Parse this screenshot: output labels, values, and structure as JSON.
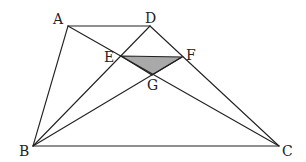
{
  "figure": {
    "type": "geometry",
    "colors": {
      "stroke": "#222222",
      "shade": "#a9a9a9",
      "background": "#ffffff"
    },
    "points": {
      "A": {
        "label": "A",
        "x": 68,
        "y": 26
      },
      "D": {
        "label": "D",
        "x": 150,
        "y": 26
      },
      "B": {
        "label": "B",
        "x": 33,
        "y": 146
      },
      "C": {
        "label": "C",
        "x": 279,
        "y": 146
      },
      "E": {
        "label": "E",
        "x": 121,
        "y": 56
      },
      "F": {
        "label": "F",
        "x": 182,
        "y": 57
      },
      "G": {
        "label": "G",
        "x": 152,
        "y": 75
      }
    },
    "segments": [
      "AD",
      "AB",
      "BC",
      "DC",
      "AC",
      "BD",
      "BF",
      "EF"
    ],
    "shaded_region": [
      "E",
      "F",
      "G"
    ]
  }
}
